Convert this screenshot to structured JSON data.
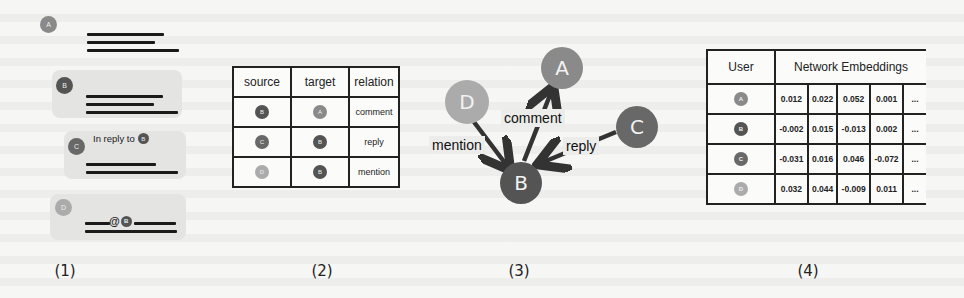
{
  "colors": {
    "user_A": "#8a8a8a",
    "user_B": "#545454",
    "user_C": "#686868",
    "user_D": "#ababab",
    "line": "#1a1a1a",
    "bubble": "#e4e4e2"
  },
  "panel1": {
    "caption": "(1)",
    "messages": [
      {
        "user": "A",
        "bubble": false
      },
      {
        "user": "B",
        "bubble": true
      },
      {
        "user": "C",
        "bubble": true,
        "reply_prefix": "In reply to",
        "reply_target": "B"
      },
      {
        "user": "D",
        "bubble": true,
        "mention_symbol": "@",
        "mention_target": "B"
      }
    ]
  },
  "panel2": {
    "caption": "(2)",
    "headers": [
      "source",
      "target",
      "relation"
    ],
    "rows": [
      {
        "source": "B",
        "target": "A",
        "relation": "comment"
      },
      {
        "source": "C",
        "target": "B",
        "relation": "reply"
      },
      {
        "source": "D",
        "target": "B",
        "relation": "mention"
      }
    ]
  },
  "panel3": {
    "caption": "(3)",
    "nodes": [
      "A",
      "B",
      "C",
      "D"
    ],
    "edges": [
      {
        "from": "B",
        "to": "A",
        "label": "comment"
      },
      {
        "from": "D",
        "to": "B",
        "label": "mention"
      },
      {
        "from": "C",
        "to": "B",
        "label": "reply"
      }
    ]
  },
  "panel4": {
    "caption": "(4)",
    "headers": {
      "user": "User",
      "embeddings": "Network Embeddings"
    },
    "ellipsis": "...",
    "rows": [
      {
        "user": "A",
        "values": [
          "0.012",
          "0.022",
          "0.052",
          "0.001"
        ]
      },
      {
        "user": "B",
        "values": [
          "-0.002",
          "0.015",
          "-0.013",
          "0.002"
        ]
      },
      {
        "user": "C",
        "values": [
          "-0.031",
          "0.016",
          "0.046",
          "-0.072"
        ]
      },
      {
        "user": "D",
        "values": [
          "0.032",
          "0.044",
          "-0.009",
          "0.011"
        ]
      }
    ]
  }
}
